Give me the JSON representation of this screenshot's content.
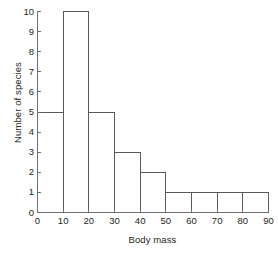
{
  "chart_data": {
    "type": "bar",
    "title": "",
    "subtitle": "",
    "xlabel": "Body mass",
    "ylabel": "Number of species",
    "bin_width": 10,
    "bin_edges": [
      0,
      10,
      20,
      30,
      40,
      50,
      60,
      70,
      80,
      90
    ],
    "categories": [
      "0-10",
      "10-20",
      "20-30",
      "30-40",
      "40-50",
      "50-60",
      "60-70",
      "70-80",
      "80-90"
    ],
    "values": [
      5,
      10,
      5,
      3,
      2,
      1,
      1,
      1,
      1
    ],
    "xlim": [
      0,
      90
    ],
    "ylim": [
      0,
      10
    ],
    "xticks": [
      0,
      10,
      20,
      30,
      40,
      50,
      60,
      70,
      80,
      90
    ],
    "yticks": [
      0,
      1,
      2,
      3,
      4,
      5,
      6,
      7,
      8,
      9,
      10
    ],
    "xtick_labels": [
      "0",
      "10",
      "20",
      "30",
      "40",
      "50",
      "60",
      "70",
      "80",
      "90"
    ],
    "ytick_labels": [
      "0",
      "1",
      "2",
      "3",
      "4",
      "5",
      "6",
      "7",
      "8",
      "9",
      "10"
    ],
    "grid": false,
    "legend": null,
    "legend_position": "none",
    "annotations": [],
    "style": {
      "bar_fill": "#ffffff",
      "bar_stroke": "#58595b",
      "bar_stroke_width": 1,
      "axis_color": "#6d6e71",
      "text_color": "#231f20",
      "background": "#ffffff",
      "tick_direction": "in",
      "spines": [
        "left",
        "bottom"
      ]
    }
  }
}
